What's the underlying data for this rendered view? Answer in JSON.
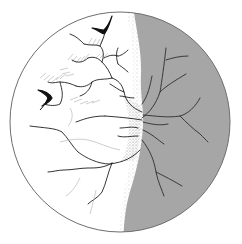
{
  "figure": {
    "colors": {
      "background": "#ffffff",
      "disc_outline": "#6e6e6e",
      "shaded_region": "#a6a6a6",
      "vessels_dark": "#1e1e1e",
      "vessels_on_gray": "#3a3a3a",
      "stipple": "#888888"
    },
    "disc": {
      "cx": 120,
      "cy": 122,
      "r": 110
    },
    "markers": [
      {
        "name": "arrowhead-marker-top",
        "x": 100,
        "y": 28
      },
      {
        "name": "arrowhead-marker-left",
        "x": 48,
        "y": 96
      }
    ]
  }
}
